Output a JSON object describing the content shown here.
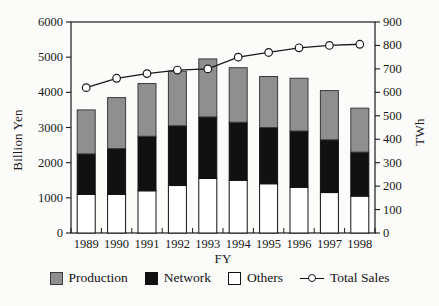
{
  "figure": {
    "background": "#fbfbfa",
    "frame_color": "#1a1a1a",
    "text_color": "#1a1a1a"
  },
  "legend": {
    "items": [
      {
        "label": "Production",
        "swatch": "gray-square",
        "color": "#8f8f8f"
      },
      {
        "label": "Network",
        "swatch": "black-square",
        "color": "#111111"
      },
      {
        "label": "Others",
        "swatch": "white-square",
        "color": "#ffffff"
      },
      {
        "label": "Total Sales",
        "swatch": "line-circle-marker",
        "color": "#1a1a1a"
      }
    ]
  },
  "chart_data": {
    "type": "bar",
    "subtype": "stacked-bars-with-line",
    "categories": [
      "1989",
      "1990",
      "1991",
      "1992",
      "1993",
      "1994",
      "1995",
      "1996",
      "1997",
      "1998"
    ],
    "series": [
      {
        "name": "Others",
        "type": "bar-stack",
        "axis": "left",
        "color": "#ffffff",
        "stroke": "#111111",
        "values": [
          1100,
          1100,
          1200,
          1350,
          1550,
          1500,
          1400,
          1300,
          1150,
          1050
        ]
      },
      {
        "name": "Network",
        "type": "bar-stack",
        "axis": "left",
        "color": "#111111",
        "stroke": "#111111",
        "values": [
          1150,
          1300,
          1550,
          1700,
          1750,
          1650,
          1600,
          1600,
          1500,
          1250
        ]
      },
      {
        "name": "Production",
        "type": "bar-stack",
        "axis": "left",
        "color": "#8f8f8f",
        "stroke": "#3a3a3a",
        "values": [
          1250,
          1450,
          1500,
          1550,
          1650,
          1550,
          1450,
          1500,
          1400,
          1250
        ]
      },
      {
        "name": "Total Sales",
        "type": "line",
        "axis": "right",
        "color": "#1a1a1a",
        "marker": "open-circle",
        "values": [
          620,
          660,
          680,
          695,
          700,
          750,
          770,
          790,
          800,
          805
        ]
      }
    ],
    "stacked_totals_left_axis": [
      3500,
      3850,
      4250,
      4600,
      4950,
      4700,
      4450,
      4400,
      4050,
      3550
    ],
    "left_axis": {
      "label": "Billion Yen",
      "min": 0,
      "max": 6000,
      "tick_step": 1000
    },
    "right_axis": {
      "label": "TWh",
      "min": 0,
      "max": 900,
      "tick_step": 100
    },
    "x_axis": {
      "label": "FY"
    },
    "grid": false,
    "legend_position": "bottom"
  }
}
